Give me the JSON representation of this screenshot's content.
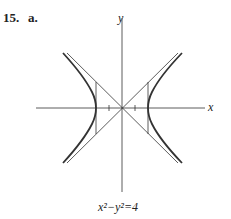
{
  "problem": {
    "number": "15.",
    "part": "a."
  },
  "axes": {
    "x_label": "x",
    "y_label": "y"
  },
  "caption": "x²−y²=4",
  "figure": {
    "equation": "x^2 - y^2 = 4",
    "vertices": [
      [
        -2,
        0
      ],
      [
        2,
        0
      ]
    ],
    "asymptotes": [
      "y = x",
      "y = -x"
    ],
    "tick_marks_x": [
      -1,
      1
    ]
  }
}
